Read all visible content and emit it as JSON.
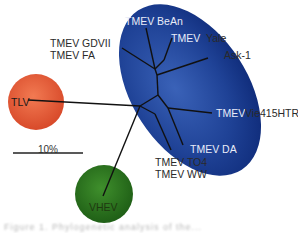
{
  "diagram": {
    "type": "phylogenetic-tree",
    "colors": {
      "tmev_cluster": "#1e3f94",
      "tlv": "#e8603a",
      "vhev": "#2f7a22",
      "branch": "#111111",
      "background": "#ffffff"
    },
    "nodes": {
      "tlv": "TLV",
      "vhev": "VHEV"
    },
    "tmev_cluster": {
      "labels": [
        "TMEV BeAn",
        "TMEV",
        "Yale",
        "Ask-1",
        "TMEV",
        "Vie415HTR",
        "TMEV DA"
      ]
    },
    "outside_labels": {
      "gdvii": "TMEV GDVII",
      "fa": "TMEV FA",
      "to4": "TMEV TO4",
      "ww": "TMEV WW"
    },
    "scale_bar": {
      "label": "10%"
    },
    "caption": "Figure 1. Phylogenetic analysis of the..."
  }
}
